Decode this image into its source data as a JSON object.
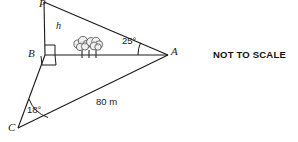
{
  "figure": {
    "type": "geometry-diagram",
    "background_color": "#ffffff",
    "stroke_color": "#1a1a1a",
    "vertices": {
      "P": {
        "label": "P",
        "x": 44,
        "y": 2
      },
      "B": {
        "label": "B",
        "x": 45,
        "y": 55
      },
      "C": {
        "label": "C",
        "x": 18,
        "y": 128
      },
      "A": {
        "label": "A",
        "x": 168,
        "y": 55
      }
    },
    "segments": [
      {
        "name": "PB",
        "from": "P",
        "to": "B"
      },
      {
        "name": "PA",
        "from": "P",
        "to": "A"
      },
      {
        "name": "BA",
        "from": "B",
        "to": "A"
      },
      {
        "name": "BC",
        "from": "B",
        "to": "C"
      },
      {
        "name": "CA",
        "from": "C",
        "to": "A"
      }
    ],
    "labels": {
      "height": "h",
      "angle_at_a": "25°",
      "angle_at_c": "18°",
      "side_ca": "80 m"
    },
    "right_angles": [
      {
        "name": "right-angle-pba",
        "at": "B",
        "between": [
          "BP",
          "BA"
        ]
      },
      {
        "name": "right-angle-abc",
        "at": "B",
        "between": [
          "BA",
          "BC"
        ]
      }
    ],
    "decoration": {
      "bushes": "tree-cluster-on-segment-BA",
      "bush_count": 3
    }
  },
  "annotation": {
    "not_to_scale": "NOT TO SCALE"
  }
}
